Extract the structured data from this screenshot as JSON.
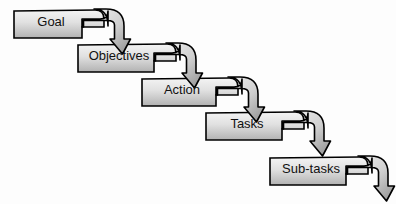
{
  "diagram": {
    "type": "waterfall-flow",
    "background_color": "#fdfdfd",
    "border_color": "#000000",
    "text_color": "#111111",
    "fill_gradient": {
      "from": "#f2f2f2",
      "mid": "#dcdcdc",
      "to": "#b4b4b4"
    },
    "arrow_fill_gradient": {
      "from": "#f5f5f5",
      "to": "#9a9a9a"
    },
    "nodes": [
      {
        "id": "goal",
        "label": "Goal",
        "x": 14,
        "y": 10,
        "width": 90,
        "height": 28,
        "notch_width": 22,
        "notch_height": 11,
        "corner": 9
      },
      {
        "id": "objectives",
        "label": "Objectives",
        "x": 78,
        "y": 44,
        "width": 98,
        "height": 28,
        "notch_width": 22,
        "notch_height": 11,
        "corner": 9
      },
      {
        "id": "action",
        "label": "Action",
        "x": 142,
        "y": 78,
        "width": 96,
        "height": 28,
        "notch_width": 22,
        "notch_height": 11,
        "corner": 9
      },
      {
        "id": "tasks",
        "label": "Tasks",
        "x": 206,
        "y": 112,
        "width": 98,
        "height": 28,
        "notch_width": 22,
        "notch_height": 11,
        "corner": 9
      },
      {
        "id": "sub-tasks",
        "label": "Sub-tasks",
        "x": 270,
        "y": 157,
        "width": 98,
        "height": 28,
        "notch_width": 22,
        "notch_height": 11,
        "corner": 9
      }
    ],
    "connections": [
      {
        "id": "goal-to-objectives",
        "from": "goal",
        "to": "objectives"
      },
      {
        "id": "objectives-to-action",
        "from": "objectives",
        "to": "action"
      },
      {
        "id": "action-to-tasks",
        "from": "action",
        "to": "tasks"
      },
      {
        "id": "tasks-to-sub-tasks",
        "from": "tasks",
        "to": "sub-tasks"
      },
      {
        "id": "sub-tasks-to-end",
        "from": "sub-tasks",
        "to": null
      }
    ]
  }
}
